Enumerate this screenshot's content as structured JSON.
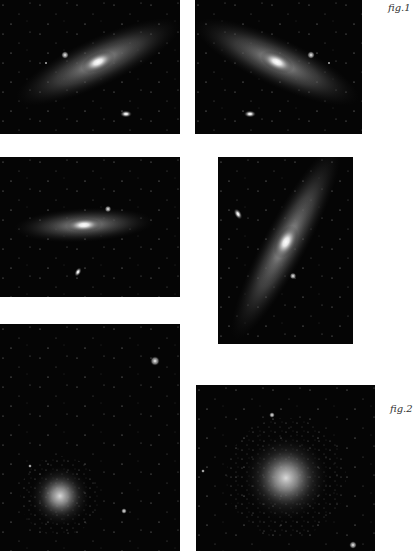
{
  "figure": {
    "labels": {
      "fig1": "fig.1",
      "fig2": "fig.2"
    },
    "panels": [
      {
        "id": "galaxy-tilted-right",
        "subject": "spiral galaxy",
        "orientation": "tilted up-right"
      },
      {
        "id": "galaxy-tilted-left",
        "subject": "spiral galaxy",
        "orientation": "mirrored, tilted up-left"
      },
      {
        "id": "galaxy-horizontal",
        "subject": "spiral galaxy",
        "orientation": "horizontal"
      },
      {
        "id": "galaxy-vertical",
        "subject": "spiral galaxy",
        "orientation": "near-vertical"
      },
      {
        "id": "cluster-lower-left",
        "subject": "globular cluster",
        "orientation": "offset lower-left"
      },
      {
        "id": "cluster-centered",
        "subject": "globular cluster",
        "orientation": "centered"
      }
    ]
  },
  "colors": {
    "background": "#ffffff",
    "sky": "#050505",
    "label": "#333333"
  }
}
